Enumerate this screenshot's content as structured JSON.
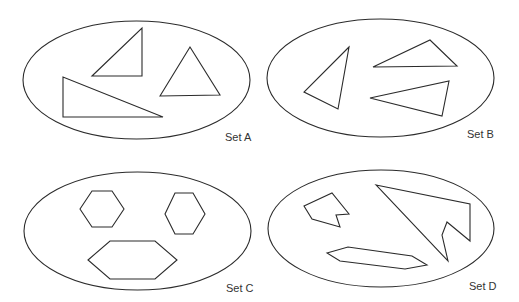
{
  "diagram": {
    "stroke_color": "#2b2b2b",
    "label_color": "#333333",
    "background": "#ffffff",
    "sets": [
      {
        "label": "Set A",
        "shape_type": "triangles",
        "ellipse": {
          "cx": 136.5,
          "cy": 80,
          "rx": 113.5,
          "ry": 59
        },
        "label_pos": {
          "x": 225,
          "y": 141
        },
        "shapes": [
          {
            "name": "right-triangle-small",
            "points": "92,76 142,28 142,76"
          },
          {
            "name": "equilateral-triangle",
            "points": "160,96 190,47 220,95"
          },
          {
            "name": "right-triangle-large",
            "points": "63,77 63,117 163,117"
          }
        ]
      },
      {
        "label": "Set B",
        "shape_type": "triangles",
        "ellipse": {
          "cx": 380.5,
          "cy": 78,
          "rx": 113.5,
          "ry": 59
        },
        "label_pos": {
          "x": 467,
          "y": 138
        },
        "shapes": [
          {
            "name": "triangle-left",
            "points": "349,47 304,92 338,109"
          },
          {
            "name": "triangle-top-right",
            "points": "373,67 430,40 457,66"
          },
          {
            "name": "triangle-bottom-right",
            "points": "370,98 449,81 442,116"
          }
        ]
      },
      {
        "label": "Set C",
        "shape_type": "hexagons",
        "ellipse": {
          "cx": 137.5,
          "cy": 231,
          "rx": 113.5,
          "ry": 59
        },
        "label_pos": {
          "x": 226,
          "y": 292
        },
        "shapes": [
          {
            "name": "hexagon-top-left",
            "points": "80,209 92,191 112,191 124,209 112,227 92,227"
          },
          {
            "name": "hexagon-top-right",
            "points": "165,214 175,193 193,193 205,214 193,234 175,234"
          },
          {
            "name": "hexagon-bottom-wide",
            "points": "88,260 110,241 155,241 177,260 155,279 110,279"
          }
        ]
      },
      {
        "label": "Set D",
        "shape_type": "irregular-polygons",
        "ellipse": {
          "cx": 381,
          "cy": 228.5,
          "rx": 113,
          "ry": 58.5
        },
        "label_pos": {
          "x": 469,
          "y": 290
        },
        "shapes": [
          {
            "name": "notched-pentagon",
            "points": "304,206 332,193 349,214 336,215 340,227 312,219"
          },
          {
            "name": "arrow-polygon",
            "points": "376,185 470,204 470,241 447,222 442,235 448,261"
          },
          {
            "name": "elongated-hexagon",
            "points": "327,253 348,247 412,256 427,265 405,269 340,261"
          }
        ]
      }
    ]
  }
}
